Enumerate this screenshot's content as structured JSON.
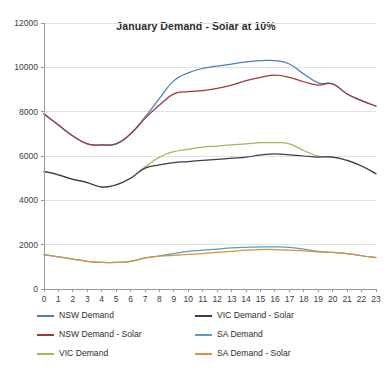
{
  "chart_data": {
    "type": "line",
    "title": "January Demand - Solar at 10%",
    "xlabel": "",
    "ylabel": "",
    "grid": true,
    "legend_position": "bottom",
    "xlim": [
      0,
      23
    ],
    "ylim": [
      0,
      12000
    ],
    "ytick_step": 2000,
    "x": [
      0,
      1,
      2,
      3,
      4,
      5,
      6,
      7,
      8,
      9,
      10,
      11,
      12,
      13,
      14,
      15,
      16,
      17,
      18,
      19,
      20,
      21,
      22,
      23
    ],
    "xticklabels": [
      "0",
      "1",
      "2",
      "3",
      "4",
      "5",
      "6",
      "7",
      "8",
      "9",
      "10",
      "11",
      "12",
      "13",
      "14",
      "15",
      "16",
      "17",
      "18",
      "19",
      "20",
      "21",
      "22",
      "23"
    ],
    "yticklabels": [
      "0",
      "2000",
      "4000",
      "6000",
      "8000",
      "10000",
      "12000"
    ],
    "yticks": [
      0,
      2000,
      4000,
      6000,
      8000,
      10000,
      12000
    ],
    "series": [
      {
        "name": "NSW Demand",
        "color": "#4a7ebb",
        "values": [
          7900,
          7400,
          6900,
          6550,
          6500,
          6550,
          7000,
          7750,
          8600,
          9400,
          9750,
          9950,
          10050,
          10150,
          10250,
          10300,
          10300,
          10150,
          9700,
          9300,
          9250,
          8800,
          8500,
          8250
        ]
      },
      {
        "name": "NSW Demand - Solar",
        "color": "#9e3b34",
        "values": [
          7900,
          7400,
          6900,
          6550,
          6500,
          6550,
          7000,
          7700,
          8300,
          8800,
          8900,
          8950,
          9050,
          9200,
          9400,
          9550,
          9650,
          9550,
          9350,
          9200,
          9250,
          8800,
          8500,
          8250
        ]
      },
      {
        "name": "VIC Demand",
        "color": "#9bbb59"
      },
      {
        "name": "VIC Demand - Solar",
        "color": "#3b3b54"
      },
      {
        "name": "SA Demand",
        "color": "#5b9bc1"
      },
      {
        "name": "SA Demand - Solar",
        "color": "#d9903f"
      }
    ],
    "series_values": {
      "VIC Demand": [
        5300,
        5150,
        4950,
        4800,
        4600,
        4700,
        5000,
        5500,
        5950,
        6200,
        6300,
        6400,
        6450,
        6500,
        6550,
        6600,
        6600,
        6550,
        6250,
        6000,
        5950,
        5800,
        5550,
        5200
      ],
      "VIC Demand - Solar": [
        5300,
        5150,
        4950,
        4800,
        4600,
        4700,
        5000,
        5450,
        5600,
        5700,
        5750,
        5800,
        5850,
        5900,
        5950,
        6050,
        6100,
        6050,
        6000,
        5950,
        5950,
        5800,
        5550,
        5200
      ],
      "SA Demand": [
        1550,
        1450,
        1350,
        1250,
        1200,
        1200,
        1250,
        1400,
        1500,
        1600,
        1700,
        1750,
        1800,
        1850,
        1880,
        1900,
        1900,
        1880,
        1800,
        1700,
        1650,
        1600,
        1500,
        1420
      ],
      "SA Demand - Solar": [
        1550,
        1450,
        1350,
        1250,
        1200,
        1200,
        1250,
        1400,
        1480,
        1520,
        1560,
        1600,
        1650,
        1700,
        1750,
        1780,
        1780,
        1750,
        1720,
        1680,
        1650,
        1600,
        1500,
        1420
      ]
    }
  },
  "legend": {
    "items": [
      {
        "label": "NSW Demand",
        "color": "#4a7ebb"
      },
      {
        "label": "VIC Demand - Solar",
        "color": "#3b3b54"
      },
      {
        "label": "NSW Demand - Solar",
        "color": "#9e3b34"
      },
      {
        "label": "SA Demand",
        "color": "#5b9bc1"
      },
      {
        "label": "VIC Demand",
        "color": "#9bbb59"
      },
      {
        "label": "SA Demand - Solar",
        "color": "#d9903f"
      }
    ]
  }
}
